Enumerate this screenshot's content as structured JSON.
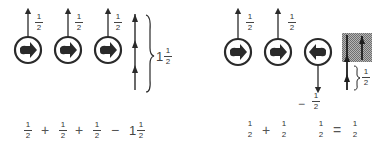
{
  "colors": {
    "ink": "#2a2a2a",
    "hatch": "#8a8a8a",
    "background": "#ffffff"
  },
  "left_panel": {
    "particles": [
      {
        "id": 1,
        "arrow_direction": "up",
        "spin_icon": "right-pointing-arrow-icon",
        "label": {
          "num": "1",
          "den": "2"
        }
      },
      {
        "id": 2,
        "arrow_direction": "up",
        "spin_icon": "right-pointing-arrow-icon",
        "label": {
          "num": "1",
          "den": "2"
        }
      },
      {
        "id": 3,
        "arrow_direction": "up",
        "spin_icon": "right-pointing-arrow-icon",
        "label": {
          "num": "1",
          "den": "2"
        }
      }
    ],
    "total": {
      "whole": "1",
      "num": "1",
      "den": "2"
    },
    "equation": {
      "terms": [
        {
          "num": "1",
          "den": "2"
        },
        {
          "op": "+"
        },
        {
          "num": "1",
          "den": "2"
        },
        {
          "op": "+"
        },
        {
          "num": "1",
          "den": "2"
        },
        {
          "op": "−"
        },
        {
          "whole": "1",
          "num": "1",
          "den": "2"
        }
      ]
    }
  },
  "right_panel": {
    "particles": [
      {
        "id": 1,
        "arrow_direction": "up",
        "spin_icon": "right-pointing-arrow-icon",
        "label": {
          "num": "1",
          "den": "2"
        }
      },
      {
        "id": 2,
        "arrow_direction": "up",
        "spin_icon": "right-pointing-arrow-icon",
        "label": {
          "num": "1",
          "den": "2"
        }
      },
      {
        "id": 3,
        "arrow_direction": "down",
        "spin_icon": "left-pointing-arrow-icon",
        "label": {
          "sign": "−",
          "num": "1",
          "den": "2"
        }
      }
    ],
    "net": {
      "num": "1",
      "den": "2"
    },
    "equation": {
      "terms": [
        {
          "num": "1",
          "den": "2"
        },
        {
          "op": "+"
        },
        {
          "num": "1",
          "den": "2"
        },
        {
          "num": "1",
          "den": "2"
        },
        {
          "op": "="
        },
        {
          "num": "1",
          "den": "2"
        }
      ]
    }
  }
}
